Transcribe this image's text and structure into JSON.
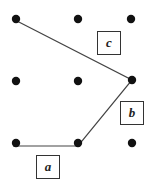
{
  "diagram": {
    "type": "geoboard-polygon",
    "colors": {
      "line": "#444444",
      "dot": "#111111",
      "box_border": "#333333"
    },
    "grid_dots": [
      {
        "x": 16,
        "y": 19
      },
      {
        "x": 78,
        "y": 19
      },
      {
        "x": 131,
        "y": 19
      },
      {
        "x": 16,
        "y": 81
      },
      {
        "x": 78,
        "y": 81
      },
      {
        "x": 132,
        "y": 80
      },
      {
        "x": 16,
        "y": 143
      },
      {
        "x": 78,
        "y": 143
      },
      {
        "x": 132,
        "y": 143
      }
    ],
    "polygon": [
      {
        "x": 13,
        "y": 19
      },
      {
        "x": 132,
        "y": 80
      },
      {
        "x": 78,
        "y": 146
      },
      {
        "x": 13,
        "y": 146
      }
    ],
    "labels": [
      {
        "id": "a",
        "text": "a",
        "left": 36,
        "top": 155,
        "width": 24,
        "height": 24
      },
      {
        "id": "b",
        "text": "b",
        "left": 120,
        "top": 101,
        "width": 24,
        "height": 24
      },
      {
        "id": "c",
        "text": "c",
        "left": 97,
        "top": 31,
        "width": 24,
        "height": 24
      }
    ]
  }
}
